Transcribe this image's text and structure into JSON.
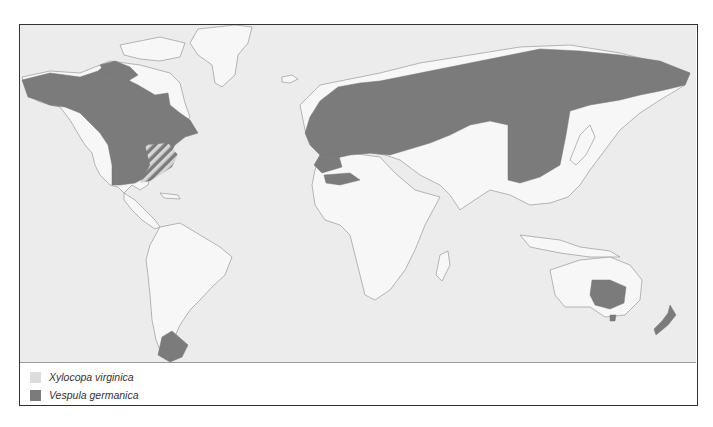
{
  "map": {
    "type": "species distribution map",
    "colors": {
      "ocean": "#ececec",
      "land": "#f7f7f7",
      "coastline": "#9a9a9a",
      "xylocopa_virginica": "#dcdcdc",
      "vespula_germanica": "#7b7b7b"
    },
    "regions": [
      {
        "name": "North America (Canada, USA)",
        "species": "Vespula germanica"
      },
      {
        "name": "Eastern USA",
        "species": "Xylocopa virginica + Vespula germanica (hatched overlap)"
      },
      {
        "name": "Europe and northern Asia",
        "species": "Vespula germanica"
      },
      {
        "name": "North Africa coast",
        "species": "Vespula germanica"
      },
      {
        "name": "Southern South America",
        "species": "Vespula germanica"
      },
      {
        "name": "Southeastern Australia and Tasmania",
        "species": "Vespula germanica"
      },
      {
        "name": "New Zealand",
        "species": "Vespula germanica"
      }
    ]
  },
  "legend": {
    "items": [
      {
        "label": "Xylocopa virginica",
        "color": "#dcdcdc"
      },
      {
        "label": "Vespula germanica",
        "color": "#7b7b7b"
      }
    ]
  }
}
